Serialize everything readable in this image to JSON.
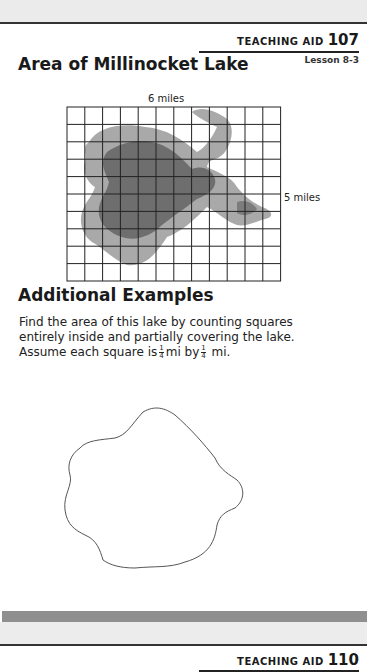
{
  "header": {
    "aid_label": "TEACHING AID",
    "aid_number": "107",
    "lesson": "Lesson 8-3"
  },
  "section1": {
    "title": "Area of Millinocket Lake",
    "width_label": "6 miles",
    "height_label": "5 miles",
    "grid": {
      "columns": 12,
      "rows": 10
    }
  },
  "section2": {
    "title": "Additional Examples",
    "prompt_line1": "Find the area of this lake by counting squares entirely inside and partially covering the lake. Assume each square",
    "prompt_is": "is",
    "prompt_mi_by": "mi by",
    "prompt_mi_end": "mi.",
    "fraction": {
      "numerator": "1",
      "denominator": "4"
    }
  },
  "footer": {
    "aid_label": "TEACHING AID",
    "aid_number": "110"
  },
  "colors": {
    "lake_light": "#a9a9a9",
    "lake_dark": "#6e6e6e",
    "grid_line": "#222222",
    "bottom_bar": "#8f8f8f"
  }
}
